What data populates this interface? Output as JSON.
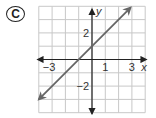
{
  "choice_label": "C",
  "chart_data": {
    "type": "line",
    "title": "",
    "xlabel": "x",
    "ylabel": "y",
    "xlim": [
      -4,
      4
    ],
    "ylim": [
      -4,
      4
    ],
    "grid": true,
    "x_tick_labels": [
      {
        "value": -3,
        "label": "−3"
      },
      {
        "value": 1,
        "label": "1"
      },
      {
        "value": 3,
        "label": "3"
      }
    ],
    "y_tick_labels": [
      {
        "value": 2,
        "label": "2"
      },
      {
        "value": -2,
        "label": "−2"
      }
    ],
    "series": [
      {
        "name": "y = x + 1",
        "equation": "y = x + 1",
        "slope": 1,
        "intercept": 1,
        "x": [
          -4,
          -1,
          0,
          2.9
        ],
        "y": [
          -3,
          0,
          1,
          3.9
        ],
        "arrows": "both",
        "color": "#666666"
      }
    ]
  },
  "colors": {
    "grid": "#c8c8c8",
    "axis": "#222222",
    "line": "#666666"
  }
}
